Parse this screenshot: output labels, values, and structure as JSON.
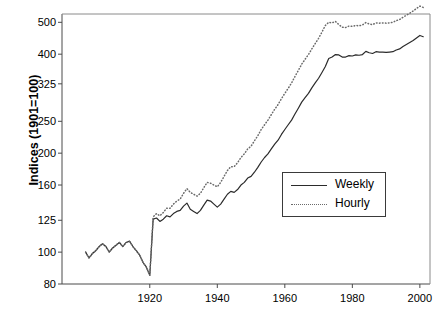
{
  "chart_data": {
    "type": "line",
    "title": "",
    "xlabel": "",
    "ylabel": "Indices (1901=100)",
    "yscale": "log",
    "ylim": [
      80,
      530
    ],
    "xlim": [
      1894,
      2003
    ],
    "grid": false,
    "legend_position": "inside-right-middle",
    "ytick_labels": [
      "80",
      "100",
      "125",
      "160",
      "200",
      "250",
      "325",
      "400",
      "500"
    ],
    "ytick_values": [
      80,
      100,
      125,
      160,
      200,
      250,
      325,
      400,
      500
    ],
    "xtick_labels": [
      "1920",
      "1940",
      "1960",
      "1980",
      "2000"
    ],
    "xtick_values": [
      1920,
      1940,
      1960,
      1980,
      2000
    ],
    "series": [
      {
        "name": "Weekly",
        "style": "solid",
        "color": "#2b2b2b",
        "x": [
          1901,
          1902,
          1903,
          1904,
          1905,
          1906,
          1907,
          1908,
          1909,
          1910,
          1911,
          1912,
          1913,
          1914,
          1915,
          1916,
          1917,
          1918,
          1919,
          1920,
          1921,
          1922,
          1923,
          1924,
          1925,
          1926,
          1927,
          1928,
          1929,
          1930,
          1931,
          1932,
          1933,
          1934,
          1935,
          1936,
          1937,
          1938,
          1939,
          1940,
          1941,
          1942,
          1943,
          1944,
          1945,
          1946,
          1947,
          1948,
          1949,
          1950,
          1951,
          1952,
          1953,
          1954,
          1955,
          1956,
          1957,
          1958,
          1959,
          1960,
          1961,
          1962,
          1963,
          1964,
          1965,
          1966,
          1967,
          1968,
          1969,
          1970,
          1971,
          1972,
          1973,
          1974,
          1975,
          1976,
          1977,
          1978,
          1979,
          1980,
          1981,
          1982,
          1983,
          1984,
          1985,
          1986,
          1987,
          1988,
          1989,
          1990,
          1991,
          1992,
          1993,
          1994,
          1995,
          1996,
          1997,
          1998,
          1999,
          2000,
          2001
        ],
        "y": [
          100,
          96,
          99,
          101,
          104,
          106,
          104,
          100,
          103,
          105,
          107,
          104,
          107,
          108,
          104,
          101,
          98,
          93,
          90,
          85,
          126,
          127,
          124,
          126,
          129,
          128,
          131,
          133,
          134,
          138,
          141,
          135,
          133,
          131,
          134,
          139,
          144,
          143,
          140,
          137,
          140,
          145,
          150,
          153,
          152,
          155,
          160,
          163,
          168,
          170,
          175,
          181,
          188,
          194,
          199,
          206,
          213,
          219,
          228,
          236,
          244,
          252,
          263,
          274,
          286,
          295,
          304,
          316,
          327,
          338,
          352,
          367,
          388,
          392,
          399,
          398,
          392,
          392,
          396,
          395,
          398,
          397,
          399,
          408,
          404,
          402,
          407,
          406,
          406,
          405,
          406,
          407,
          412,
          415,
          422,
          428,
          434,
          440,
          448,
          456,
          452
        ]
      },
      {
        "name": "Hourly",
        "style": "dotted",
        "color": "#6a6a6a",
        "x": [
          1901,
          1902,
          1903,
          1904,
          1905,
          1906,
          1907,
          1908,
          1909,
          1910,
          1911,
          1912,
          1913,
          1914,
          1915,
          1916,
          1917,
          1918,
          1919,
          1920,
          1921,
          1922,
          1923,
          1924,
          1925,
          1926,
          1927,
          1928,
          1929,
          1930,
          1931,
          1932,
          1933,
          1934,
          1935,
          1936,
          1937,
          1938,
          1939,
          1940,
          1941,
          1942,
          1943,
          1944,
          1945,
          1946,
          1947,
          1948,
          1949,
          1950,
          1951,
          1952,
          1953,
          1954,
          1955,
          1956,
          1957,
          1958,
          1959,
          1960,
          1961,
          1962,
          1963,
          1964,
          1965,
          1966,
          1967,
          1968,
          1969,
          1970,
          1971,
          1972,
          1973,
          1974,
          1975,
          1976,
          1977,
          1978,
          1979,
          1980,
          1981,
          1982,
          1983,
          1984,
          1985,
          1986,
          1987,
          1988,
          1989,
          1990,
          1991,
          1992,
          1993,
          1994,
          1995,
          1996,
          1997,
          1998,
          1999,
          2000,
          2001
        ],
        "y": [
          100,
          96,
          99,
          101,
          104,
          106,
          104,
          100,
          103,
          105,
          107,
          104,
          107,
          108,
          104,
          101,
          98,
          93,
          90,
          85,
          128,
          131,
          129,
          132,
          136,
          136,
          140,
          143,
          145,
          151,
          156,
          152,
          150,
          148,
          151,
          157,
          163,
          162,
          160,
          158,
          163,
          170,
          177,
          182,
          182,
          187,
          194,
          199,
          206,
          210,
          218,
          226,
          236,
          244,
          252,
          262,
          272,
          281,
          293,
          304,
          315,
          327,
          342,
          357,
          373,
          386,
          399,
          415,
          431,
          447,
          467,
          489,
          500,
          498,
          503,
          492,
          483,
          482,
          487,
          486,
          489,
          488,
          491,
          499,
          494,
          492,
          498,
          497,
          498,
          497,
          498,
          500,
          506,
          510,
          518,
          525,
          533,
          541,
          551,
          560,
          555
        ]
      }
    ]
  },
  "legend": {
    "items": [
      {
        "label": "Weekly",
        "style": "solid"
      },
      {
        "label": "Hourly",
        "style": "dotted"
      }
    ]
  },
  "axis": {
    "y_title": "Indices (1901=100)"
  }
}
